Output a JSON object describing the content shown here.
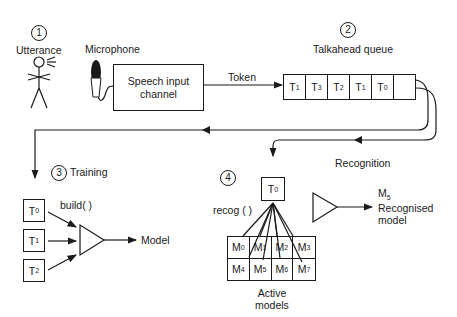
{
  "steps": {
    "utterance": {
      "number": "1",
      "label": "Utterance"
    },
    "queue": {
      "number": "2",
      "label": "Talkahead queue"
    },
    "training": {
      "number": "3",
      "label": "Training"
    },
    "recognition": {
      "number": "4"
    }
  },
  "microphone_label": "Microphone",
  "speech_channel": {
    "line1": "Speech input",
    "line2": "channel"
  },
  "token_label": "Token",
  "queue_cells": [
    {
      "base": "T",
      "sub": "1"
    },
    {
      "base": "T",
      "sub": "3"
    },
    {
      "base": "T",
      "sub": "2"
    },
    {
      "base": "T",
      "sub": "1"
    },
    {
      "base": "T",
      "sub": "0"
    },
    {
      "base": "",
      "sub": ""
    }
  ],
  "recognition_label": "Recognition",
  "training_tokens": [
    {
      "base": "T",
      "sub": "0"
    },
    {
      "base": "T",
      "sub": "1"
    },
    {
      "base": "T",
      "sub": "2"
    }
  ],
  "build_label": "build(  )",
  "model_label": "Model",
  "recog_token": {
    "base": "T",
    "sub": "0"
  },
  "recog_label": "recog (  )",
  "active_models": [
    {
      "base": "M",
      "sub": "0"
    },
    {
      "base": "M",
      "sub": "1"
    },
    {
      "base": "M",
      "sub": "2"
    },
    {
      "base": "M",
      "sub": "3"
    },
    {
      "base": "M",
      "sub": "4"
    },
    {
      "base": "M",
      "sub": "5"
    },
    {
      "base": "M",
      "sub": "6"
    },
    {
      "base": "M",
      "sub": "7"
    }
  ],
  "active_models_label": {
    "line1": "Active",
    "line2": "models"
  },
  "recognised": {
    "base": "M",
    "sub": "5",
    "line1": "Recognised",
    "line2": "model"
  }
}
